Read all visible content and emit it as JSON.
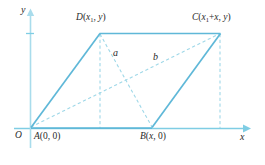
{
  "figure": {
    "background_color": "#ffffff",
    "axes": {
      "x_label": "x",
      "y_label": "y",
      "origin_label": "O",
      "axis_color": "#7fcde4",
      "tick_color": "#7fcde4"
    },
    "colors": {
      "solid_line": "#5fb8d8",
      "dashed_line": "#9fd8e8",
      "text": "#2a2a2a"
    },
    "points": {
      "A": {
        "label_main": "A",
        "label_coords": "(0, 0)",
        "x": 30,
        "y": 128
      },
      "B": {
        "label_main": "B",
        "label_coords": "(x, 0)",
        "x": 152,
        "y": 128
      },
      "C": {
        "label_main": "C",
        "label_sub": "1",
        "label_pre": "(x",
        "label_post": "+x, y)",
        "x": 220,
        "y": 33
      },
      "D": {
        "label_main": "D",
        "label_sub": "1",
        "label_pre": "(x",
        "label_post": ", y)",
        "x": 100,
        "y": 33
      }
    },
    "segments": {
      "a_label": "a",
      "b_label": "b"
    },
    "solid_edges": [
      {
        "name": "edge-A-D",
        "from": "A",
        "to": "D"
      },
      {
        "name": "edge-D-C",
        "from": "D",
        "to": "C"
      },
      {
        "name": "edge-B-C",
        "from": "B",
        "to": "C"
      },
      {
        "name": "edge-A-B",
        "from": "A",
        "to": "B"
      }
    ],
    "dashed_edges": [
      {
        "name": "diagonal-a-D-B",
        "from": "D",
        "to": "B"
      },
      {
        "name": "diagonal-b-A-C",
        "from": "A",
        "to": "C"
      },
      {
        "name": "dropline-D",
        "from": "D",
        "to": "x-axis"
      },
      {
        "name": "dropline-C",
        "from": "C",
        "to": "x-axis"
      }
    ]
  }
}
